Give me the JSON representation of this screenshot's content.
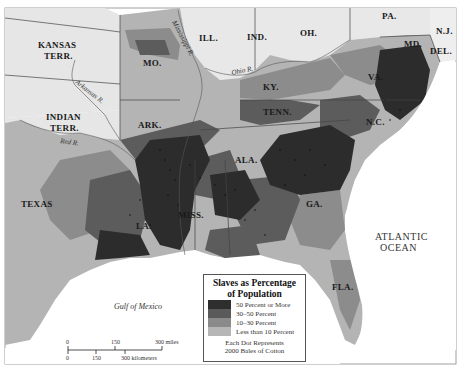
{
  "map": {
    "title": "Slaves as Percentage of Population",
    "background_color": "#ffffff",
    "land_color_free": "#e8e8e8"
  },
  "labels": {
    "states": [
      {
        "name": "KANSAS",
        "x": 60,
        "y": 48
      },
      {
        "name": "TERR.",
        "x": 66,
        "y": 59
      },
      {
        "name": "INDIAN",
        "x": 61,
        "y": 118
      },
      {
        "name": "TERR.",
        "x": 65,
        "y": 129
      },
      {
        "name": "MO.",
        "x": 150,
        "y": 66
      },
      {
        "name": "ILL.",
        "x": 233,
        "y": 41
      },
      {
        "name": "IND.",
        "x": 274,
        "y": 40
      },
      {
        "name": "OH.",
        "x": 320,
        "y": 37
      },
      {
        "name": "PA.",
        "x": 388,
        "y": 19
      },
      {
        "name": "N.J.",
        "x": 437,
        "y": 34
      },
      {
        "name": "DEL.",
        "x": 430,
        "y": 54
      },
      {
        "name": "MD.",
        "x": 407,
        "y": 47
      },
      {
        "name": "KY.",
        "x": 268,
        "y": 90
      },
      {
        "name": "VA.",
        "x": 371,
        "y": 80
      },
      {
        "name": "TENN.",
        "x": 268,
        "y": 115
      },
      {
        "name": "N.C.",
        "x": 376,
        "y": 125
      },
      {
        "name": "ARK.",
        "x": 143,
        "y": 128
      },
      {
        "name": "ALA.",
        "x": 237,
        "y": 163
      },
      {
        "name": "GA.",
        "x": 312,
        "y": 207
      },
      {
        "name": "MISS.",
        "x": 185,
        "y": 218
      },
      {
        "name": "LA.",
        "x": 141,
        "y": 229
      },
      {
        "name": "TEXAS",
        "x": 21,
        "y": 207
      },
      {
        "name": "FLA.",
        "x": 340,
        "y": 290
      },
      {
        "name": "S.C.",
        "x": 340,
        "y": 165
      }
    ],
    "rivers": [
      {
        "name": "Mississippi R.",
        "x": 176,
        "y": 25,
        "rotate": 62
      },
      {
        "name": "Ohio R.",
        "x": 238,
        "y": 73,
        "rotate": -12
      },
      {
        "name": "Arkansas R.",
        "x": 78,
        "y": 90,
        "rotate": 38
      },
      {
        "name": "Red R.",
        "x": 63,
        "y": 142,
        "rotate": 8
      },
      {
        "name": "Cumberland R.",
        "x": 260,
        "y": 98,
        "rotate": -20
      },
      {
        "name": "Tennessee R.",
        "x": 290,
        "y": 112,
        "rotate": -25
      }
    ],
    "water": [
      {
        "name": "ATLANTIC",
        "x": 380,
        "y": 240
      },
      {
        "name": "OCEAN",
        "x": 386,
        "y": 251
      },
      {
        "name": "Gulf of Mexico",
        "x": 115,
        "y": 309
      }
    ]
  },
  "legend": {
    "title_line1": "Slaves as Percentage",
    "title_line2": "of Population",
    "items": [
      {
        "label": "50 Percent or More",
        "color": "#2e2e2e"
      },
      {
        "label": "30–50 Percent",
        "color": "#5a5a5a"
      },
      {
        "label": "10–30 Percent",
        "color": "#8a8a8a"
      },
      {
        "label": "Less than 10 Percent",
        "color": "#b6b6b6"
      }
    ],
    "note_line1": "Each Dot Represents",
    "note_line2": "2000 Bales of Cotton"
  },
  "scale_bar": {
    "miles_labels": [
      "0",
      "150",
      "300 miles"
    ],
    "km_labels": [
      "0",
      "150",
      "300 kilometers"
    ]
  }
}
